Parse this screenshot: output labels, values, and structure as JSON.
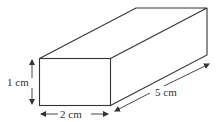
{
  "diagram": {
    "type": "cuboid",
    "labels": {
      "height": "1 cm",
      "width": "2 cm",
      "length": "5 cm"
    },
    "colors": {
      "edge": "#333333",
      "arrow": "#333333",
      "background": "#ffffff"
    }
  }
}
